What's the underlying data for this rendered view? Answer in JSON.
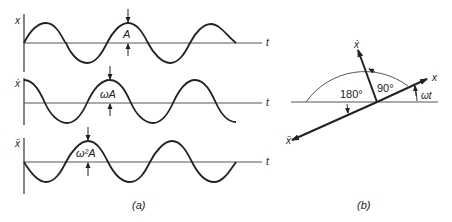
{
  "figure": {
    "panel_a": {
      "caption": "(a)",
      "plots": [
        {
          "ylabel": "x",
          "xlabel": "t",
          "amplitude_label": "A",
          "phase": "sin"
        },
        {
          "ylabel": "ẋ",
          "xlabel": "t",
          "amplitude_label": "ωA",
          "phase": "cos"
        },
        {
          "ylabel": "ẍ",
          "xlabel": "t",
          "amplitude_label": "ω²A",
          "phase": "-sin"
        }
      ]
    },
    "panel_b": {
      "caption": "(b)",
      "vectors": {
        "x": "x",
        "xdot": "ẋ",
        "xddot": "ẍ"
      },
      "angles": {
        "xdot_from_x": "90°",
        "xddot_from_x": "180°",
        "x_from_horizontal": "ωt"
      }
    }
  }
}
